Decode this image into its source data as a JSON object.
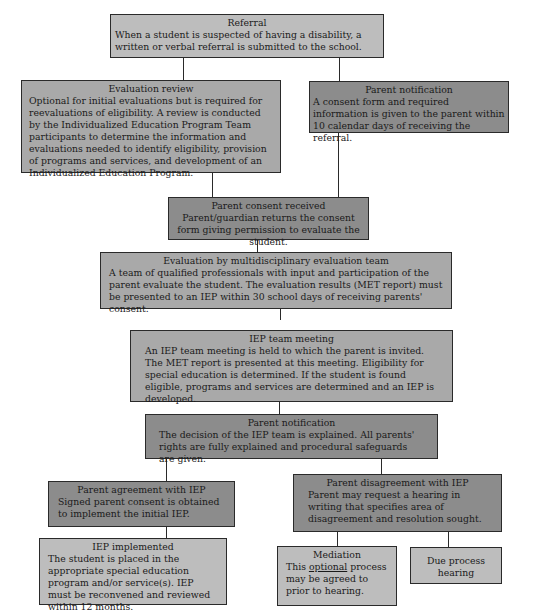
{
  "diagram": {
    "type": "flowchart",
    "nodes": [
      {
        "id": "referral",
        "title": "Referral",
        "body": "When a student is suspected of having a disability, a written or verbal referral is submitted to the school."
      },
      {
        "id": "evaluation_review",
        "title": "Evaluation review",
        "body": "Optional for initial evaluations but is required for reevaluations of eligibility. A review is conducted by the Individualized Education Program Team participants to determine the information and evaluations needed to identify eligibility, provision of programs and services, and development of an Individualized Education Program."
      },
      {
        "id": "parent_notification_1",
        "title": "Parent notification",
        "body": "A consent form and required information is given to the parent within 10 calendar days of receiving the referral."
      },
      {
        "id": "parent_consent",
        "title": "Parent consent received",
        "body": "Parent/guardian returns the consent form giving permission to evaluate the student."
      },
      {
        "id": "met_evaluation",
        "title": "Evaluation by multidisciplinary evaluation team",
        "body": "A team of qualified professionals with input and participation of the parent evaluate the student. The evaluation results (MET report) must be presented to an IEP within 30 school days of receiving parents' consent."
      },
      {
        "id": "iep_meeting",
        "title": "IEP team meeting",
        "body": "An IEP team meeting is held to which the parent is invited. The MET report is presented at this meeting. Eligibility for special education is determined. If the student is found eligible, programs and services are determined and an IEP is developed."
      },
      {
        "id": "parent_notification_2",
        "title": "Parent notification",
        "body": "The decision of the IEP team is explained. All parents' rights are fully explained and procedural safeguards are given."
      },
      {
        "id": "parent_agreement",
        "title": "Parent agreement with IEP",
        "body": "Signed parent consent is obtained to implement the initial IEP."
      },
      {
        "id": "parent_disagreement",
        "title": "Parent disagreement with IEP",
        "body": "Parent may request a hearing in writing that specifies area of disagreement and resolution sought."
      },
      {
        "id": "iep_implemented",
        "title": "IEP implemented",
        "body": "The student is placed in the appropriate special education program and/or service(s). IEP must be reconvened and reviewed within 12 months."
      },
      {
        "id": "mediation",
        "title": "Mediation",
        "body_pre": "This ",
        "body_underlined": "optional",
        "body_post": " process may be agreed to prior to hearing."
      },
      {
        "id": "due_process",
        "title": "Due process hearing"
      }
    ],
    "edges": [
      [
        "referral",
        "evaluation_review"
      ],
      [
        "referral",
        "parent_notification_1"
      ],
      [
        "evaluation_review",
        "parent_consent"
      ],
      [
        "parent_notification_1",
        "parent_consent"
      ],
      [
        "parent_consent",
        "met_evaluation"
      ],
      [
        "met_evaluation",
        "iep_meeting"
      ],
      [
        "iep_meeting",
        "parent_notification_2"
      ],
      [
        "parent_notification_2",
        "parent_agreement"
      ],
      [
        "parent_notification_2",
        "parent_disagreement"
      ],
      [
        "parent_agreement",
        "iep_implemented"
      ],
      [
        "parent_disagreement",
        "mediation"
      ],
      [
        "parent_disagreement",
        "due_process"
      ]
    ],
    "colors": {
      "light": "#bdbdbd",
      "mid": "#a9a9a9",
      "dark": "#8c8c8c",
      "border": "#2a2a2a"
    }
  }
}
